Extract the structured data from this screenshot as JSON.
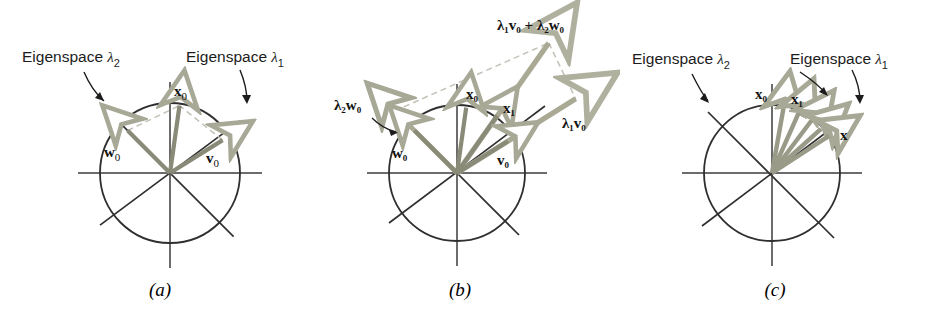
{
  "figure": {
    "background_color": "#ffffff",
    "axis_color": "#3b3b3b",
    "circle_color": "#2f2f2f",
    "eigenline_color": "#2f2f2f",
    "vector_color": "#8a8a78",
    "vector_color_light": "#b9b9a8",
    "dashed_color": "#bdbdb4",
    "text_color": "#1c1c1c"
  },
  "panels": [
    {
      "id": "a",
      "caption": "(a)",
      "center": {
        "x": 170,
        "y": 173
      },
      "radius": 70,
      "labels": {
        "eigenspace_2": {
          "text": "Eigenspace ",
          "symbol": "λ",
          "sub": "2"
        },
        "eigenspace_1": {
          "text": "Eigenspace ",
          "symbol": "λ",
          "sub": "1"
        }
      },
      "vectors": [
        {
          "name": "w",
          "sub": "0",
          "label": "w₀",
          "angle_deg": 135,
          "length": 60,
          "style": "solid"
        },
        {
          "name": "x",
          "sub": "0",
          "label": "x₀",
          "angle_deg": 82,
          "length": 68,
          "style": "solid"
        },
        {
          "name": "v",
          "sub": "0",
          "label": "v₀",
          "angle_deg": 32,
          "length": 62,
          "style": "solid"
        }
      ],
      "dashed_parallelogram": true,
      "eigenline_angles_deg": [
        32,
        135
      ]
    },
    {
      "id": "b",
      "caption": "(b)",
      "center": {
        "x": 457,
        "y": 173
      },
      "radius": 68,
      "labels": {
        "sum_vector": {
          "text": "λ₁v₀ + λ₂w₀"
        },
        "lambda2_w0": {
          "text": "λ₂w₀"
        },
        "lambda1_v0": {
          "text": "λ₁v₀"
        },
        "x0": {
          "text": "x₀"
        },
        "x1": {
          "text": "x₁"
        },
        "w0": {
          "text": "w₀"
        },
        "v0": {
          "text": "v₀"
        }
      },
      "vectors": [
        {
          "label": "λ₂w₀",
          "angle_deg": 135,
          "length": 88,
          "style": "solid"
        },
        {
          "label": "w₀",
          "angle_deg": 135,
          "length": 60,
          "style": "solid"
        },
        {
          "label": "x₀",
          "angle_deg": 82,
          "length": 66,
          "style": "solid"
        },
        {
          "label": "x₁",
          "angle_deg": 55,
          "length": 70,
          "style": "solid"
        },
        {
          "label": "v₀",
          "angle_deg": 32,
          "length": 60,
          "style": "solid"
        },
        {
          "label": "λ₁v₀",
          "angle_deg": 32,
          "length": 140,
          "style": "solid"
        },
        {
          "label": "λ₁v₀ + λ₂w₀",
          "angle_deg": 55,
          "length": 160,
          "style": "solid"
        }
      ],
      "dashed_parallelogram": true,
      "eigenline_angles_deg": [
        32,
        135
      ]
    },
    {
      "id": "c",
      "caption": "(c)",
      "center": {
        "x": 772,
        "y": 173
      },
      "radius": 68,
      "labels": {
        "eigenspace_2": {
          "text": "Eigenspace ",
          "symbol": "λ",
          "sub": "2"
        },
        "eigenspace_1": {
          "text": "Eigenspace ",
          "symbol": "λ",
          "sub": "1"
        },
        "x0": {
          "text": "x₀"
        },
        "x1": {
          "text": "x₁"
        },
        "x": {
          "text": "x"
        }
      },
      "vectors": [
        {
          "label": "x₀",
          "angle_deg": 80,
          "length": 66,
          "style": "solid"
        },
        {
          "label": "x₁",
          "angle_deg": 66,
          "length": 66,
          "style": "solid"
        },
        {
          "label": "",
          "angle_deg": 53,
          "length": 66,
          "style": "solid"
        },
        {
          "label": "",
          "angle_deg": 42,
          "length": 66,
          "style": "solid"
        },
        {
          "label": "x",
          "angle_deg": 33,
          "length": 68,
          "style": "solid"
        }
      ],
      "eigenline_angles_deg": [
        32,
        135
      ]
    }
  ]
}
